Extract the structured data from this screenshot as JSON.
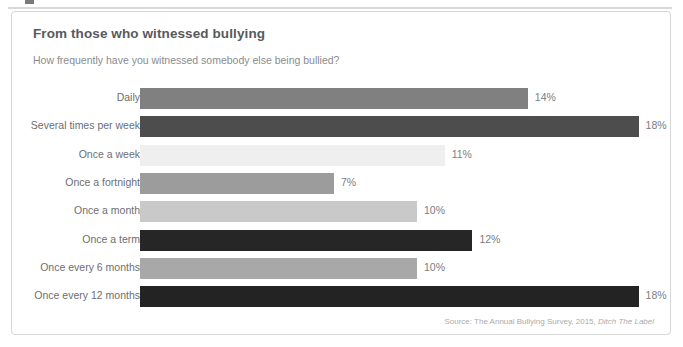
{
  "card": {
    "title": "From those who witnessed bullying",
    "subtitle": "How frequently have you witnessed somebody else being bullied?",
    "source_prefix": "Source: The Annual Bullying Survey, 2015, ",
    "source_publisher": "Ditch The Label"
  },
  "colors": {
    "card_border": "#d6d6d6",
    "title": "#58595b",
    "subtitle": "#8a8c8e",
    "label": "#6d6e71",
    "value": "#7b7d7f",
    "source": "#a9abad",
    "background": "#ffffff"
  },
  "chart_data": {
    "type": "bar",
    "orientation": "horizontal",
    "title": "From those who witnessed bullying",
    "subtitle": "How frequently have you witnessed somebody else being bullied?",
    "xlabel": "",
    "ylabel": "",
    "xlim": [
      0,
      19
    ],
    "grid": false,
    "legend": false,
    "value_suffix": "%",
    "px_per_unit": 27.7,
    "categories": [
      "Daily",
      "Several times per week",
      "Once a week",
      "Once a fortnight",
      "Once a month",
      "Once a term",
      "Once every 6 months",
      "Once every 12 months"
    ],
    "values": [
      14,
      18,
      11,
      7,
      10,
      12,
      10,
      18
    ],
    "value_labels": [
      "14%",
      "18%",
      "11%",
      "7%",
      "10%",
      "12%",
      "10%",
      "18%"
    ],
    "bar_colors": [
      "#808080",
      "#4d4d4d",
      "#efefef",
      "#9c9c9c",
      "#c9c9c9",
      "#262626",
      "#a8a8a8",
      "#232323"
    ],
    "source": "Source: The Annual Bullying Survey, 2015, Ditch The Label"
  }
}
